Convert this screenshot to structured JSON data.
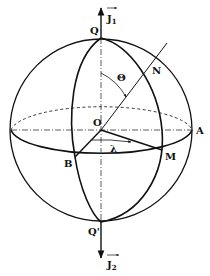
{
  "diagram": {
    "title": "",
    "labels": {
      "J1": "J",
      "J1_sub": "1",
      "J2": "J",
      "J2_sub": "2",
      "Q": "Q",
      "Q_prime": "Q'",
      "O": "O",
      "N": "N",
      "A": "A",
      "B": "B",
      "M": "M",
      "theta": "Θ",
      "lambda": "λ"
    },
    "colors": {
      "stroke": "#111111",
      "background": "#ffffff"
    }
  }
}
